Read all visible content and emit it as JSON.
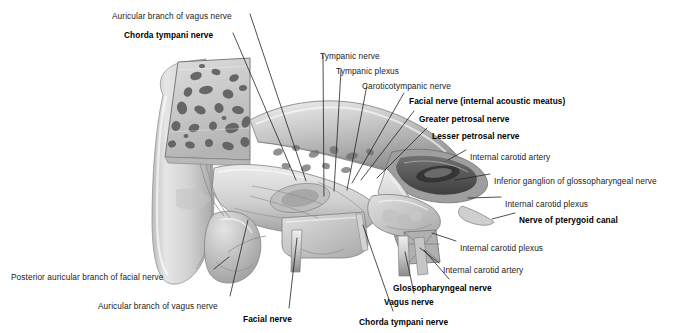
{
  "figure": {
    "type": "anatomical-illustration",
    "style": "grayscale pencil/airbrush medical illustration",
    "background_color": "#ffffff",
    "ink_color": "#222222",
    "palette": {
      "bone_light": "#e9e9e9",
      "bone_mid": "#c9c9c9",
      "bone_shadow": "#9a9a9a",
      "air_cells_dark": "#6a6a6a",
      "deep_shadow": "#4a4a4a",
      "nerve_pale": "#dcdcdc",
      "leader_line": "#232323"
    },
    "leader_line_width_px": 0.8
  },
  "labels": [
    {
      "id": "auricular-branch-vagus-top",
      "text": "Auricular branch of vagus nerve",
      "bold": false,
      "x": 112,
      "y": 11,
      "anchor": "start"
    },
    {
      "id": "chorda-tympani-top",
      "text": "Chorda tympani nerve",
      "bold": true,
      "x": 124,
      "y": 30,
      "anchor": "start"
    },
    {
      "id": "tympanic-nerve",
      "text": "Tympanic nerve",
      "bold": false,
      "x": 320,
      "y": 51,
      "anchor": "start"
    },
    {
      "id": "tympanic-plexus",
      "text": "Tympanic plexus",
      "bold": false,
      "x": 336,
      "y": 66,
      "anchor": "start"
    },
    {
      "id": "caroticotympanic-nerve",
      "text": "Caroticotympanic nerve",
      "bold": false,
      "x": 362,
      "y": 81,
      "anchor": "start"
    },
    {
      "id": "facial-nerve-iam",
      "text": "Facial nerve (internal acoustic meatus)",
      "bold": true,
      "x": 409,
      "y": 96,
      "anchor": "start"
    },
    {
      "id": "greater-petrosal-nerve",
      "text": "Greater petrosal nerve",
      "bold": true,
      "x": 419,
      "y": 114,
      "anchor": "start"
    },
    {
      "id": "lesser-petrosal-nerve",
      "text": "Lesser petrosal nerve",
      "bold": true,
      "x": 432,
      "y": 131,
      "anchor": "start"
    },
    {
      "id": "internal-carotid-artery-1",
      "text": "Internal carotid artery",
      "bold": false,
      "x": 470,
      "y": 152,
      "anchor": "start"
    },
    {
      "id": "inferior-ganglion-glosso",
      "text": "Inferior ganglion of glossopharyngeal nerve",
      "bold": false,
      "x": 494,
      "y": 176,
      "anchor": "start"
    },
    {
      "id": "internal-carotid-plexus-1",
      "text": "Internal carotid plexus",
      "bold": false,
      "x": 505,
      "y": 199,
      "anchor": "start"
    },
    {
      "id": "nerve-of-pterygoid-canal",
      "text": "Nerve of pterygoid canal",
      "bold": true,
      "x": 519,
      "y": 215,
      "anchor": "start"
    },
    {
      "id": "internal-carotid-plexus-2",
      "text": "Internal carotid plexus",
      "bold": false,
      "x": 460,
      "y": 243,
      "anchor": "start"
    },
    {
      "id": "internal-carotid-artery-2",
      "text": "Internal carotid artery",
      "bold": false,
      "x": 443,
      "y": 265,
      "anchor": "start"
    },
    {
      "id": "posterior-auricular-branch",
      "text": "Posterior auricular branch of facial nerve",
      "bold": false,
      "x": 11,
      "y": 272,
      "anchor": "start"
    },
    {
      "id": "auricular-branch-vagus-bot",
      "text": "Auricular branch of vagus nerve",
      "bold": false,
      "x": 98,
      "y": 301,
      "anchor": "start"
    },
    {
      "id": "facial-nerve-bottom",
      "text": "Facial nerve",
      "bold": true,
      "x": 243,
      "y": 314,
      "anchor": "start"
    },
    {
      "id": "glossopharyngeal-nerve",
      "text": "Glossopharyngeal nerve",
      "bold": true,
      "x": 393,
      "y": 283,
      "anchor": "start"
    },
    {
      "id": "vagus-nerve",
      "text": "Vagus nerve",
      "bold": true,
      "x": 384,
      "y": 297,
      "anchor": "start"
    },
    {
      "id": "chorda-tympani-bottom",
      "text": "Chorda tympani nerve",
      "bold": true,
      "x": 359,
      "y": 317,
      "anchor": "start"
    }
  ],
  "leader_lines": [
    {
      "id": "leader-auricular-vagus-top",
      "for": "auricular-branch-vagus-top",
      "points": "250,14 306,181"
    },
    {
      "id": "leader-chorda-tympani-top",
      "for": "chorda-tympani-top",
      "points": "233,33 296,180"
    },
    {
      "id": "leader-tympanic-nerve",
      "for": "tympanic-nerve",
      "points": "323,55 324,196"
    },
    {
      "id": "leader-tympanic-plexus",
      "for": "tympanic-plexus",
      "points": "341,70 334,191"
    },
    {
      "id": "leader-caroticotympanic",
      "for": "caroticotympanic-nerve",
      "points": "367,85 347,190"
    },
    {
      "id": "leader-facial-nerve-iam",
      "for": "facial-nerve-iam",
      "points": "404,93 352,183"
    },
    {
      "id": "leader-greater-petrosal",
      "for": "greater-petrosal-nerve",
      "points": "414,111 361,180"
    },
    {
      "id": "leader-lesser-petrosal",
      "for": "lesser-petrosal-nerve",
      "points": "427,128 377,178"
    },
    {
      "id": "leader-ica-1",
      "for": "internal-carotid-artery-1",
      "points": "466,150 448,160"
    },
    {
      "id": "leader-inferior-ganglion",
      "for": "inferior-ganglion-glosso",
      "points": "490,174 455,180"
    },
    {
      "id": "leader-icp-1",
      "for": "internal-carotid-plexus-1",
      "points": "501,197 468,198"
    },
    {
      "id": "leader-pterygoid-canal",
      "for": "nerve-of-pterygoid-canal",
      "points": "515,213 492,219"
    },
    {
      "id": "leader-icp-2",
      "for": "internal-carotid-plexus-2",
      "points": "456,241 432,233"
    },
    {
      "id": "leader-ica-2",
      "for": "internal-carotid-artery-2",
      "points": "439,263 420,248"
    },
    {
      "id": "leader-posterior-auricular",
      "for": "posterior-auricular-branch",
      "points": "214,269 229,257"
    },
    {
      "id": "leader-auricular-vagus-bot",
      "for": "auricular-branch-vagus-bot",
      "points": "230,296 248,220"
    },
    {
      "id": "leader-facial-nerve-bottom",
      "for": "facial-nerve-bottom",
      "points": "289,308 297,238"
    },
    {
      "id": "leader-glossopharyngeal",
      "for": "glossopharyngeal-nerve",
      "points": "449,279 424,250"
    },
    {
      "id": "leader-vagus-nerve",
      "for": "vagus-nerve",
      "points": "414,293 405,252"
    },
    {
      "id": "leader-chorda-tympani-bot",
      "for": "chorda-tympani-bottom",
      "points": "393,311 363,225"
    }
  ]
}
